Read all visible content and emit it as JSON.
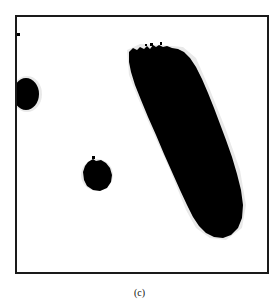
{
  "figure": {
    "caption": "(c)",
    "colors": {
      "background": "#ffffff",
      "foreground": "#000000",
      "frame": "#1a1a1a",
      "halo": "#d9d9d9"
    },
    "frame": {
      "x": 16,
      "y": 16,
      "width": 252,
      "height": 257,
      "stroke_width": 2
    },
    "blobs": [
      {
        "name": "left-edge-blob",
        "shape": "clipped-ellipse",
        "cx": 26,
        "cy": 94,
        "rx": 13,
        "ry": 16
      },
      {
        "name": "small-round-blob",
        "shape": "circle",
        "cx": 97,
        "cy": 175,
        "r": 14
      },
      {
        "name": "large-elongated-blob",
        "shape": "tilted-capsule",
        "top_left": [
          128,
          48
        ],
        "bottom": [
          225,
          237
        ]
      },
      {
        "name": "tiny-speck",
        "shape": "rect",
        "x": 17,
        "y": 33,
        "w": 3,
        "h": 3
      }
    ]
  }
}
